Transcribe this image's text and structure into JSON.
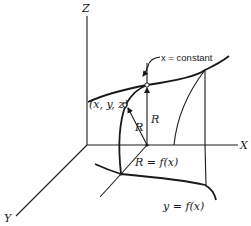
{
  "diagram": {
    "axes": {
      "z_label": "Z",
      "x_label": "X",
      "y_label": "Y"
    },
    "labels": {
      "x_constant": "x = constant",
      "point": "(x, y, z)",
      "radius_vertical": "R",
      "radius_point": "R",
      "radius_func": "R = f(x)",
      "curve_func": "y = f(x)"
    },
    "colors": {
      "ink": "#1a1a1a",
      "background": "#ffffff"
    }
  }
}
